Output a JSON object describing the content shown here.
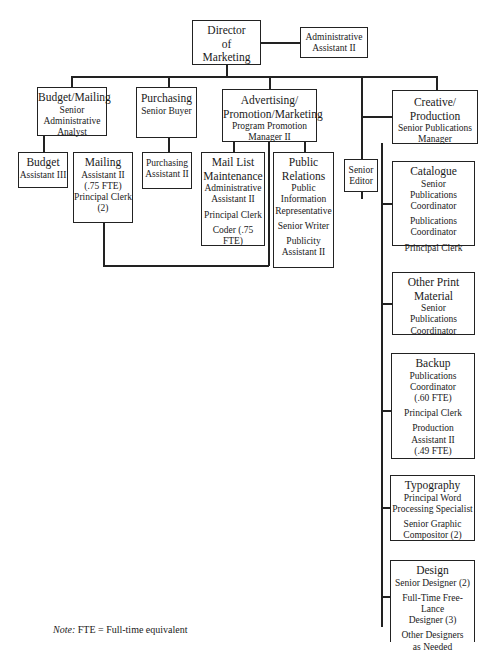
{
  "chart": {
    "director": {
      "title": "Director",
      "title2": "of",
      "title3": "Marketing"
    },
    "admin_assistant": {
      "line1": "Administrative",
      "line2": "Assistant II"
    },
    "budget_mailing": {
      "title": "Budget/Mailing",
      "roles": [
        "Senior",
        "Administrative",
        "Analyst"
      ]
    },
    "budget": {
      "title": "Budget",
      "role": "Assistant III"
    },
    "mailing": {
      "title": "Mailing",
      "roles": [
        "Assistant II",
        "(.75 FTE)",
        "Principal Clerk",
        "(2)"
      ]
    },
    "purchasing": {
      "title": "Purchasing",
      "role": "Senior Buyer"
    },
    "purchasing_assistant": {
      "line1": "Purchasing",
      "line2": "Assistant II"
    },
    "advertising": {
      "title": "Advertising/",
      "title2": "Promotion/Marketing",
      "roles": [
        "Program Promotion",
        "Manager II"
      ]
    },
    "mail_list": {
      "title": "Mail List",
      "title2": "Maintenance",
      "roles": [
        "Administrative",
        "Assistant II"
      ],
      "role2": "Principal Clerk",
      "role3": "Coder (.75 FTE)"
    },
    "public_relations": {
      "title": "Public",
      "title2": "Relations",
      "roles": [
        "Public",
        "Information",
        "Representative"
      ],
      "role2": "Senior Writer",
      "role3a": "Publicity",
      "role3b": "Assistant II"
    },
    "senior_editor": {
      "line1": "Senior",
      "line2": "Editor"
    },
    "creative": {
      "title": "Creative/",
      "title2": "Production",
      "roles": [
        "Senior Publications",
        "Manager"
      ]
    },
    "catalogue": {
      "title": "Catalogue",
      "roles": [
        "Senior",
        "Publications",
        "Coordinator"
      ],
      "roles2": [
        "Publications",
        "Coordinator"
      ],
      "role3": "Principal Clerk"
    },
    "other_print": {
      "title": "Other Print",
      "title2": "Material",
      "roles": [
        "Senior",
        "Publications",
        "Coordinator"
      ]
    },
    "backup": {
      "title": "Backup",
      "roles": [
        "Publications",
        "Coordinator",
        "(.60 FTE)"
      ],
      "role2": "Principal Clerk",
      "roles3": [
        "Production",
        "Assistant II",
        "(.49 FTE)"
      ]
    },
    "typography": {
      "title": "Typography",
      "roles": [
        "Principal Word",
        "Processing Specialist"
      ],
      "roles2": [
        "Senior Graphic",
        "Compositor (2)"
      ]
    },
    "design": {
      "title": "Design",
      "role1": "Senior Designer (2)",
      "roles2": [
        "Full-Time Free-Lance",
        "Designer (3)"
      ],
      "roles3": [
        "Other Designers",
        "as Needed"
      ]
    }
  },
  "note": {
    "label": "Note:",
    "text": " FTE = Full-time equivalent"
  }
}
